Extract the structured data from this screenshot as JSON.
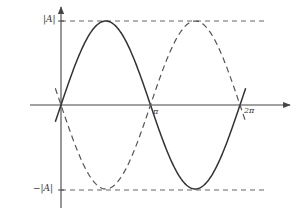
{
  "chart_data": {
    "type": "line",
    "title": "",
    "xlabel": "",
    "ylabel": "",
    "x_tick_labels": [
      "π",
      "2π"
    ],
    "y_tick_labels": [
      "|A|",
      "−|A|"
    ],
    "xlim": [
      0,
      6.2832
    ],
    "ylim": [
      -1,
      1
    ],
    "grid": false,
    "legend": null,
    "reference_lines": [
      {
        "y": 1,
        "style": "dashed",
        "label": "|A|"
      },
      {
        "y": -1,
        "style": "dashed",
        "label": "−|A|"
      }
    ],
    "series": [
      {
        "name": "A·sin(x)",
        "style": "solid",
        "x": [
          0,
          0.785,
          1.571,
          2.356,
          3.142,
          3.927,
          4.712,
          5.498,
          6.283
        ],
        "values": [
          0,
          0.707,
          1,
          0.707,
          0,
          -0.707,
          -1,
          -0.707,
          0
        ]
      },
      {
        "name": "−A·sin(x)",
        "style": "dashed",
        "x": [
          0,
          0.785,
          1.571,
          2.356,
          3.142,
          3.927,
          4.712,
          5.498,
          6.283
        ],
        "values": [
          0,
          -0.707,
          -1,
          -0.707,
          0,
          0.707,
          1,
          0.707,
          0
        ]
      }
    ]
  },
  "labels": {
    "y_top": "|A|",
    "y_bottom": "−|A|",
    "x_pi": "π",
    "x_2pi": "2π"
  },
  "colors": {
    "line": "#333333",
    "axis": "#444444",
    "dash": "#555555"
  }
}
